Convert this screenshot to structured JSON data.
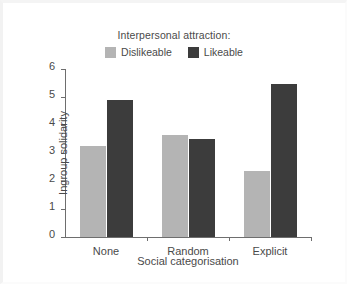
{
  "chart_data": {
    "type": "bar",
    "title": "",
    "legend_title": "Interpersonal attraction:",
    "legend_position": "top-center",
    "categories": [
      "None",
      "Random",
      "Explicit"
    ],
    "series": [
      {
        "name": "Dislikeable",
        "color": "#b4b4b4",
        "values": [
          3.25,
          3.65,
          2.35
        ]
      },
      {
        "name": "Likeable",
        "color": "#3c3c3c",
        "values": [
          4.9,
          3.5,
          5.45
        ]
      }
    ],
    "xlabel": "Social categorisation",
    "ylabel": "Ingroup solidarity",
    "ylim": [
      0,
      6
    ],
    "yticks": [
      0,
      1,
      2,
      3,
      4,
      5,
      6
    ],
    "ytick_labels": [
      "0",
      "1",
      "2",
      "3",
      "4",
      "5",
      "6"
    ],
    "grid": false,
    "axis_color": "#6e6e6e",
    "background": "#ffffff"
  }
}
